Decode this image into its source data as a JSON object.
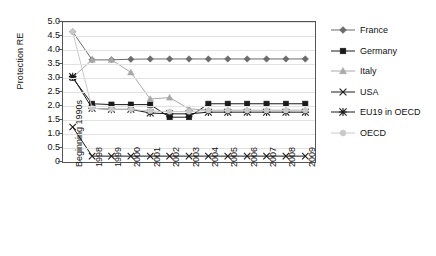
{
  "chart_data": {
    "type": "line",
    "title": "",
    "xlabel": "",
    "ylabel": "Protection RE",
    "ylim": [
      0,
      5.0
    ],
    "ytick_labels": [
      "5.0",
      "4.5",
      "4.0",
      "3.5",
      "3.0",
      "2.5",
      "2.0",
      "1.5",
      "1.0",
      "0.5",
      "0"
    ],
    "ytick_values": [
      5.0,
      4.5,
      4.0,
      3.5,
      3.0,
      2.5,
      2.0,
      1.5,
      1.0,
      0.5,
      0
    ],
    "grid": true,
    "legend_position": "right",
    "categories": [
      "Beginning 1990s",
      "1998",
      "1999",
      "2000",
      "2001",
      "2002",
      "2003",
      "2004",
      "2005",
      "2006",
      "2007",
      "2008",
      "2009"
    ],
    "series": [
      {
        "name": "France",
        "marker": "diamond",
        "color": "#6b6b6b",
        "values": [
          4.65,
          3.65,
          3.65,
          3.67,
          3.68,
          3.68,
          3.68,
          3.68,
          3.68,
          3.68,
          3.68,
          3.68,
          3.68
        ]
      },
      {
        "name": "Germany",
        "marker": "square",
        "color": "#1a1a1a",
        "values": [
          3.0,
          2.08,
          2.05,
          2.05,
          2.05,
          1.6,
          1.6,
          2.08,
          2.08,
          2.08,
          2.08,
          2.08,
          2.08
        ]
      },
      {
        "name": "Italy",
        "marker": "triangle",
        "color": "#a8a8a8",
        "values": [
          3.02,
          3.65,
          3.65,
          3.2,
          2.25,
          2.3,
          1.9,
          1.85,
          1.85,
          1.85,
          1.85,
          1.85,
          1.85
        ]
      },
      {
        "name": "USA",
        "marker": "cross",
        "color": "#1a1a1a",
        "values": [
          1.25,
          0.21,
          0.21,
          0.21,
          0.21,
          0.21,
          0.21,
          0.21,
          0.21,
          0.21,
          0.21,
          0.21,
          0.21
        ]
      },
      {
        "name": "EU19 in OECD",
        "marker": "asterisk",
        "color": "#1a1a1a",
        "values": [
          3.05,
          1.92,
          1.88,
          1.88,
          1.75,
          1.72,
          1.72,
          1.78,
          1.78,
          1.78,
          1.78,
          1.78,
          1.78
        ]
      },
      {
        "name": "OECD",
        "marker": "circle",
        "color": "#c9c9c9",
        "values": [
          4.65,
          1.92,
          1.88,
          1.88,
          1.82,
          1.8,
          1.8,
          1.84,
          1.84,
          1.84,
          1.84,
          1.84,
          1.84
        ]
      }
    ]
  },
  "legend": {
    "items": [
      {
        "label": "France"
      },
      {
        "label": "Germany"
      },
      {
        "label": "Italy"
      },
      {
        "label": "USA"
      },
      {
        "label": "EU19 in OECD"
      },
      {
        "label": "OECD"
      }
    ]
  }
}
